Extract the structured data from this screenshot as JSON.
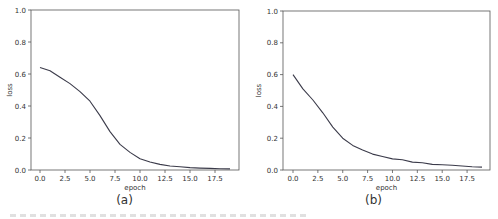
{
  "chart_data": [
    {
      "type": "line",
      "panel_label": "(a)",
      "title": "",
      "xlabel": "epoch",
      "ylabel": "loss",
      "xlim": [
        -1,
        20
      ],
      "ylim": [
        0.0,
        1.0
      ],
      "xticks": [
        "0.0",
        "2.5",
        "5.0",
        "7.5",
        "10.0",
        "12.5",
        "15.0",
        "17.5"
      ],
      "yticks": [
        "0.0",
        "0.2",
        "0.4",
        "0.6",
        "0.8",
        "1.0"
      ],
      "grid": false,
      "legend": null,
      "x": [
        0,
        1,
        2,
        3,
        4,
        5,
        6,
        7,
        8,
        9,
        10,
        11,
        12,
        13,
        14,
        15,
        16,
        17,
        18,
        19
      ],
      "series": [
        {
          "name": "loss",
          "color": "#3b3b4a",
          "values": [
            0.64,
            0.62,
            0.58,
            0.54,
            0.49,
            0.43,
            0.34,
            0.24,
            0.16,
            0.11,
            0.07,
            0.05,
            0.035,
            0.025,
            0.02,
            0.015,
            0.012,
            0.01,
            0.008,
            0.007
          ]
        }
      ]
    },
    {
      "type": "line",
      "panel_label": "(b)",
      "title": "",
      "xlabel": "epoch",
      "ylabel": "loss",
      "xlim": [
        -1,
        20
      ],
      "ylim": [
        0.0,
        1.0
      ],
      "xticks": [
        "0.0",
        "2.5",
        "5.0",
        "7.5",
        "10.0",
        "12.5",
        "15.0",
        "17.5"
      ],
      "yticks": [
        "0.0",
        "0.2",
        "0.4",
        "0.6",
        "0.8",
        "1.0"
      ],
      "grid": false,
      "legend": null,
      "x": [
        0,
        1,
        2,
        3,
        4,
        5,
        6,
        7,
        8,
        9,
        10,
        11,
        12,
        13,
        14,
        15,
        16,
        17,
        18,
        19
      ],
      "series": [
        {
          "name": "loss",
          "color": "#3b3b4a",
          "values": [
            0.6,
            0.51,
            0.44,
            0.36,
            0.27,
            0.2,
            0.155,
            0.125,
            0.1,
            0.085,
            0.07,
            0.065,
            0.05,
            0.045,
            0.035,
            0.033,
            0.03,
            0.025,
            0.02,
            0.018
          ]
        }
      ]
    }
  ],
  "captions": {
    "a": "(a)",
    "b": "(b)"
  }
}
